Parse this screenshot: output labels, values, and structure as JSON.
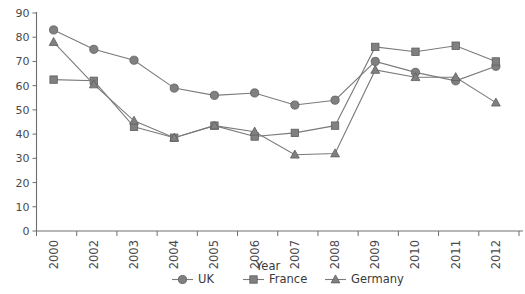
{
  "chart_data": {
    "type": "line",
    "title": "",
    "xlabel": "Year",
    "ylabel": "",
    "categories": [
      "2000",
      "2002",
      "2003",
      "2004",
      "2005",
      "2006",
      "2007",
      "2008",
      "2009",
      "2010",
      "2011",
      "2012"
    ],
    "ylim": [
      0,
      90
    ],
    "ytick_values": [
      0,
      10,
      20,
      30,
      40,
      50,
      60,
      70,
      80,
      90
    ],
    "ytick_labels": [
      "0",
      "10",
      "20",
      "30",
      "40",
      "50",
      "60",
      "70",
      "80",
      "90"
    ],
    "grid": false,
    "legend_position": "bottom",
    "series": [
      {
        "name": "UK",
        "marker": "circle",
        "color": "#808080",
        "values": [
          83,
          75,
          70.5,
          59,
          56,
          57,
          52,
          54,
          70,
          65.5,
          62,
          68
        ]
      },
      {
        "name": "France",
        "marker": "square",
        "color": "#808080",
        "values": [
          62.5,
          62,
          43,
          38.5,
          43.5,
          39,
          40.5,
          43.5,
          76,
          74,
          76.5,
          70
        ]
      },
      {
        "name": "Germany",
        "marker": "triangle",
        "color": "#808080",
        "values": [
          78,
          60.5,
          45.5,
          38.5,
          43.5,
          41,
          31.5,
          32,
          66.5,
          63.5,
          63.5,
          53
        ]
      }
    ]
  },
  "legend": {
    "items": [
      {
        "label": "UK",
        "marker": "circle"
      },
      {
        "label": "France",
        "marker": "square"
      },
      {
        "label": "Germany",
        "marker": "triangle"
      }
    ]
  },
  "axes": {
    "x_axis_title": "Year"
  }
}
